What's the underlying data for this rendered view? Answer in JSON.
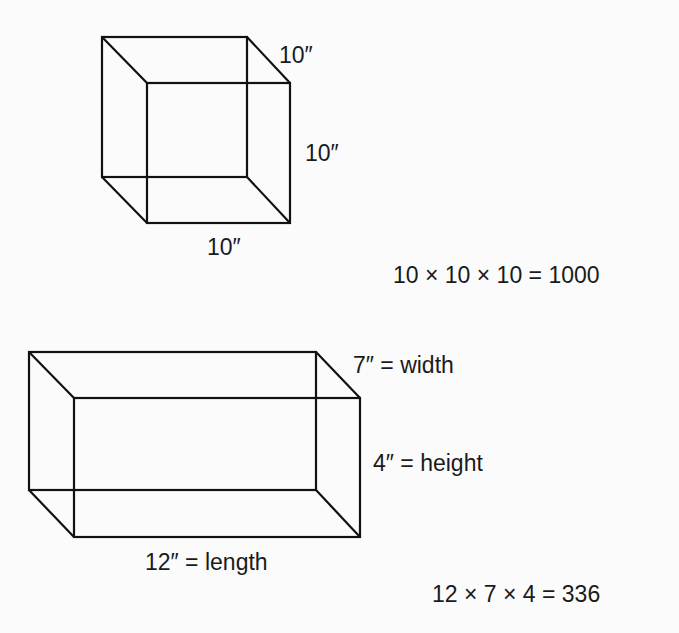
{
  "cube": {
    "top_edge_label": "10″",
    "right_edge_label": "10″",
    "bottom_edge_label": "10″",
    "equation": "10 × 10 × 10 = 1000"
  },
  "box": {
    "width_label": "7″ = width",
    "height_label": "4″ = height",
    "length_label": "12″ = length",
    "equation": "12 × 7 × 4 = 336"
  }
}
